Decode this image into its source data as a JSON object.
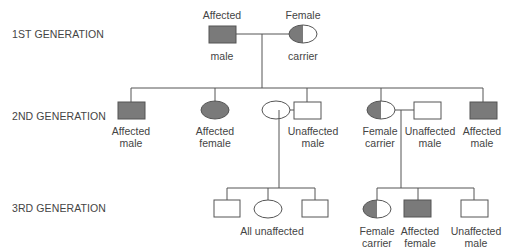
{
  "colors": {
    "affected": "#7a7a7a",
    "unaffected": "#ffffff",
    "line": "#555555",
    "text": "#444444"
  },
  "generations": [
    {
      "label": "1ST GENERATION"
    },
    {
      "label": "2ND GENERATION"
    },
    {
      "label": "3RD GENERATION"
    }
  ],
  "gen1": {
    "father": {
      "shape": "square",
      "status": "affected",
      "caption_top": "Affected",
      "caption_bottom": "male"
    },
    "mother": {
      "shape": "circle",
      "status": "carrier",
      "caption_top": "Female",
      "caption_bottom": "carrier"
    }
  },
  "gen2": [
    {
      "shape": "square",
      "status": "affected",
      "caption": [
        "Affected",
        "male"
      ]
    },
    {
      "shape": "circle",
      "status": "affected",
      "caption": [
        "Affected",
        "female"
      ]
    },
    {
      "shape": "circle",
      "status": "unaffected",
      "caption": []
    },
    {
      "shape": "square",
      "status": "unaffected",
      "caption": [
        "Unaffected",
        "male"
      ]
    },
    {
      "shape": "circle",
      "status": "carrier",
      "caption": [
        "Female",
        "carrier"
      ]
    },
    {
      "shape": "square",
      "status": "unaffected",
      "caption": [
        "Unaffected",
        "male"
      ]
    },
    {
      "shape": "square",
      "status": "affected",
      "caption": [
        "Affected",
        "male"
      ]
    }
  ],
  "gen3_left": {
    "children": [
      {
        "shape": "square",
        "status": "unaffected"
      },
      {
        "shape": "circle",
        "status": "unaffected"
      },
      {
        "shape": "square",
        "status": "unaffected"
      }
    ],
    "caption": "All unaffected"
  },
  "gen3_right": [
    {
      "shape": "circle",
      "status": "carrier",
      "caption": [
        "Female",
        "carrier"
      ]
    },
    {
      "shape": "square",
      "status": "affected",
      "caption": [
        "Affected",
        "female"
      ]
    },
    {
      "shape": "square",
      "status": "unaffected",
      "caption": [
        "Unaffected",
        "male"
      ]
    }
  ]
}
